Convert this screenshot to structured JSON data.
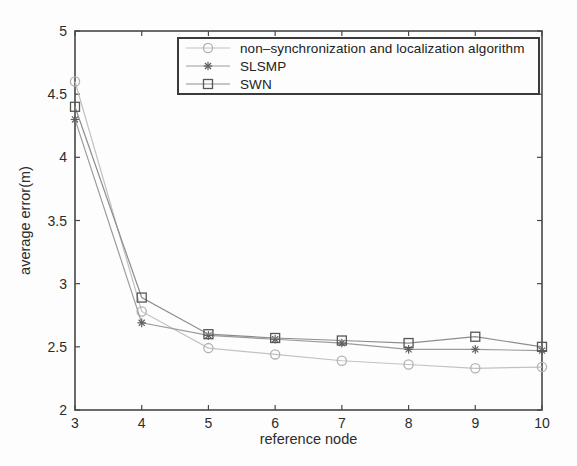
{
  "chart_data": {
    "type": "line",
    "xlabel": "reference node",
    "ylabel": "average error(m)",
    "xlim": [
      3,
      10
    ],
    "ylim": [
      2,
      5
    ],
    "xticks": [
      3,
      4,
      5,
      6,
      7,
      8,
      9,
      10
    ],
    "yticks": [
      2,
      2.5,
      3,
      3.5,
      4,
      4.5,
      5
    ],
    "grid": false,
    "legend_position": "upper center",
    "x": [
      3,
      4,
      5,
      6,
      7,
      8,
      9,
      10
    ],
    "series": [
      {
        "name": "non–synchronization and localization algorithm",
        "marker": "circle",
        "line_color": "#c2c2c2",
        "marker_color": "#b2b2b2",
        "values": [
          4.6,
          2.78,
          2.49,
          2.44,
          2.39,
          2.36,
          2.33,
          2.34
        ]
      },
      {
        "name": "SLSMP",
        "marker": "asterisk",
        "line_color": "#9b9b9b",
        "marker_color": "#5f5f5f",
        "values": [
          4.3,
          2.69,
          2.59,
          2.56,
          2.53,
          2.48,
          2.48,
          2.47
        ]
      },
      {
        "name": "SWN",
        "marker": "square",
        "line_color": "#8d8d8d",
        "marker_color": "#575757",
        "values": [
          4.4,
          2.89,
          2.6,
          2.57,
          2.55,
          2.53,
          2.58,
          2.5
        ]
      }
    ],
    "frame_color": "#474747",
    "text_color": "#2c2c2c"
  }
}
